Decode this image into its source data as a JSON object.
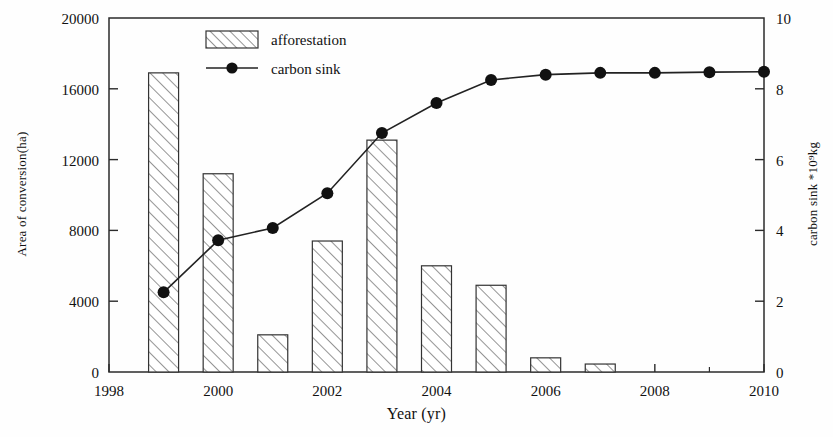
{
  "chart_data": {
    "type": "bar",
    "title": "",
    "xlabel": "Year (yr)",
    "ylabel": "Area of conversion(ha)",
    "ylabel_right": "carbon sink *10⁹kg",
    "grid": false,
    "legend_position": "top-center",
    "xlim": [
      1998,
      2010
    ],
    "ylim": [
      0,
      20000
    ],
    "ylim_right": [
      0,
      10
    ],
    "x_ticks": [
      1998,
      2000,
      2002,
      2004,
      2006,
      2008,
      2010
    ],
    "x_tick_labels": [
      "1998",
      "2000",
      "2002",
      "2004",
      "2006",
      "2008",
      "2010"
    ],
    "x_minor_tick_step": 1,
    "y_ticks": [
      0,
      4000,
      8000,
      12000,
      16000,
      20000
    ],
    "y_tick_labels": [
      "0",
      "4000",
      "8000",
      "12000",
      "16000",
      "20000"
    ],
    "y_ticks_right": [
      0,
      2,
      4,
      6,
      8,
      10
    ],
    "y_tick_labels_right": [
      "0",
      "2",
      "4",
      "6",
      "8",
      "10"
    ],
    "categories": [
      1999,
      2000,
      2001,
      2002,
      2003,
      2004,
      2005,
      2006,
      2007,
      2008,
      2009,
      2010
    ],
    "series": [
      {
        "name": "afforestation",
        "axis": "left",
        "type": "bar",
        "style": "hatched",
        "values": [
          16900,
          11200,
          2100,
          7400,
          13100,
          6000,
          4900,
          800,
          450,
          0,
          0,
          0
        ]
      },
      {
        "name": "carbon sink",
        "axis": "right",
        "type": "line",
        "marker": "filled-circle",
        "values": [
          2.25,
          3.72,
          4.07,
          5.05,
          6.75,
          7.6,
          8.25,
          8.4,
          8.45,
          8.45,
          8.47,
          8.48
        ]
      }
    ],
    "colors": {
      "axis": "#2b2b2b",
      "bar_edge": "#333333",
      "bar_fill": "#ffffff",
      "hatch": "#555555",
      "line": "#222222",
      "marker": "#111111"
    }
  },
  "legend": {
    "items": [
      {
        "label": "afforestation",
        "symbol": "hatched-rect"
      },
      {
        "label": "carbon sink",
        "symbol": "line-marker"
      }
    ]
  }
}
